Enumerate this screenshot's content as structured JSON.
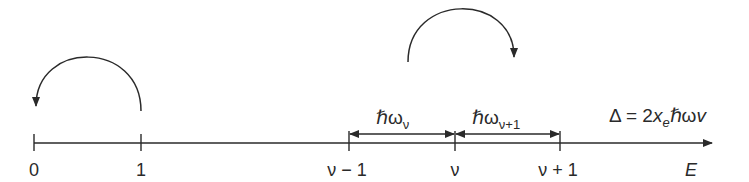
{
  "diagram": {
    "type": "energy-level-axis",
    "axis": {
      "label": "E",
      "ticks": [
        {
          "id": "t0",
          "label": "0",
          "x": 34
        },
        {
          "id": "t1",
          "label": "1",
          "x": 141
        },
        {
          "id": "tvm1",
          "label": "ν − 1",
          "x": 349
        },
        {
          "id": "tv",
          "label": "ν",
          "x": 455
        },
        {
          "id": "tvp1",
          "label": "ν + 1",
          "x": 560
        }
      ]
    },
    "spacings": [
      {
        "id": "gap_v",
        "symbol": "ℏω",
        "subscript": "ν",
        "from": "ν − 1",
        "to": "ν"
      },
      {
        "id": "gap_v1",
        "symbol": "ℏω",
        "subscript": "ν+1",
        "from": "ν",
        "to": "ν + 1"
      }
    ],
    "annotation": {
      "prefix": "Δ = 2",
      "var": "x",
      "var_sub": "e",
      "suffix": "ℏω",
      "tail": "v"
    },
    "arrows": [
      {
        "id": "arc_left",
        "description": "curved arrow from level 1 back to 0"
      },
      {
        "id": "arc_right",
        "description": "curved arrow over level ν toward ν + 1"
      }
    ],
    "colors": {
      "line": "#2a2a2a",
      "background": "#ffffff"
    }
  }
}
